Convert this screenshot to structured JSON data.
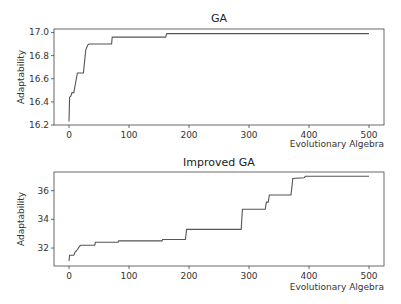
{
  "chart_data": [
    {
      "type": "line",
      "title": "GA",
      "xlabel": "Evolutionary Algebra",
      "ylabel": "Adaptability",
      "xlim": [
        -25,
        525
      ],
      "ylim": [
        16.2,
        17.03
      ],
      "xticks": [
        0,
        100,
        200,
        300,
        400,
        500
      ],
      "yticks": [
        16.2,
        16.4,
        16.6,
        16.8,
        17.0
      ],
      "ytick_labels": [
        "16.2",
        "16.4",
        "16.6",
        "16.8",
        "17.0"
      ],
      "grid": false,
      "step": true,
      "x": [
        0,
        1,
        3,
        5,
        8,
        14,
        15,
        24,
        26,
        28,
        31,
        33,
        71,
        72,
        161,
        163,
        500
      ],
      "y": [
        16.23,
        16.44,
        16.45,
        16.48,
        16.48,
        16.65,
        16.65,
        16.65,
        16.75,
        16.85,
        16.89,
        16.9,
        16.9,
        16.96,
        16.96,
        16.99,
        16.99
      ],
      "color": "#555555"
    },
    {
      "type": "line",
      "title": "Improved GA",
      "xlabel": "Evolutionary Algebra",
      "ylabel": "Adaptability",
      "xlim": [
        -25,
        525
      ],
      "ylim": [
        30.75,
        37.3
      ],
      "xticks": [
        0,
        100,
        200,
        300,
        400,
        500
      ],
      "yticks": [
        32,
        34,
        36
      ],
      "ytick_labels": [
        "32",
        "34",
        "36"
      ],
      "grid": false,
      "step": true,
      "x": [
        0,
        1,
        8,
        10,
        14,
        18,
        20,
        43,
        44,
        82,
        83,
        155,
        156,
        194,
        196,
        287,
        289,
        327,
        329,
        332,
        334,
        370,
        373,
        392,
        394,
        500
      ],
      "y": [
        31.1,
        31.5,
        31.5,
        31.7,
        31.9,
        32.15,
        32.2,
        32.2,
        32.4,
        32.4,
        32.5,
        32.5,
        32.6,
        32.6,
        33.3,
        33.3,
        34.7,
        34.7,
        35.2,
        35.2,
        35.7,
        35.7,
        36.85,
        36.9,
        37.0,
        37.0
      ],
      "color": "#555555"
    }
  ]
}
